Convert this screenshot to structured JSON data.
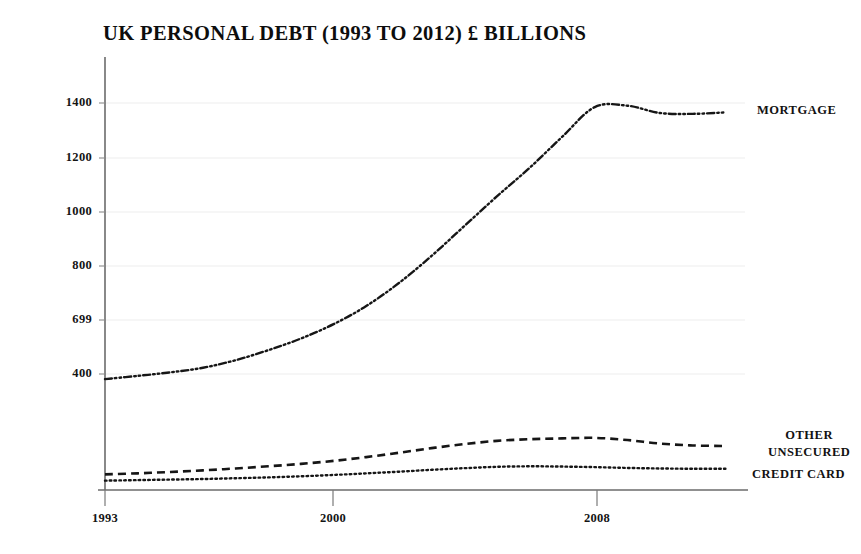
{
  "chart_data": {
    "type": "line",
    "title": "UK PERSONAL DEBT (1993 TO 2012) £ BILLIONS",
    "xlabel": "",
    "ylabel": "",
    "xlim": [
      1993,
      2012.6
    ],
    "ylim": [
      0,
      1520
    ],
    "grid": true,
    "legend_position": "right-of-line-ends",
    "x_ticks": [
      "1993",
      "2000",
      "2008"
    ],
    "x_tick_values": [
      1993,
      2000,
      2008
    ],
    "y_ticks": [
      "400",
      "699",
      "800",
      "1000",
      "1200",
      "1400"
    ],
    "y_tick_values": [
      400,
      600,
      800,
      1000,
      1200,
      1400
    ],
    "x": [
      1993,
      1994,
      1995,
      1996,
      1997,
      1998,
      1999,
      2000,
      2001,
      2002,
      2003,
      2004,
      2005,
      2006,
      2007,
      2008,
      2009,
      2010,
      2011,
      2012
    ],
    "series": [
      {
        "name": "MORTGAGE",
        "line_style": "dash-dot-dot",
        "color": "#161616",
        "values": [
          380,
          392,
          405,
          422,
          450,
          487,
          530,
          583,
          650,
          735,
          835,
          945,
          1055,
          1160,
          1275,
          1385,
          1390,
          1363,
          1360,
          1365
        ]
      },
      {
        "name": "OTHER UNSECURED",
        "line_style": "dashed",
        "color": "#161616",
        "values": [
          28,
          32,
          37,
          43,
          50,
          58,
          67,
          78,
          92,
          108,
          125,
          140,
          152,
          158,
          161,
          163,
          155,
          142,
          135,
          133
        ]
      },
      {
        "name": "CREDIT CARD",
        "line_style": "dotted",
        "color": "#161616",
        "values": [
          5,
          7,
          9,
          11,
          14,
          17,
          21,
          26,
          32,
          38,
          45,
          51,
          56,
          58,
          57,
          55,
          52,
          50,
          49,
          49
        ]
      }
    ]
  },
  "labels": {
    "mortgage": "MORTGAGE",
    "other_unsecured_line1": "OTHER",
    "other_unsecured_line2": "UNSECURED",
    "credit_card": "CREDIT CARD"
  },
  "axis": {
    "y_tick_1400": "1400",
    "y_tick_1200": "1200",
    "y_tick_1000": "1000",
    "y_tick_800": "800",
    "y_tick_600": "699",
    "y_tick_400": "400",
    "x_tick_1993": "1993",
    "x_tick_2000": "2000",
    "x_tick_2008": "2008"
  },
  "colors": {
    "background": "#ffffff",
    "ink": "#161616",
    "axis": "#5a5a5a",
    "grid": "#eeeeee"
  }
}
